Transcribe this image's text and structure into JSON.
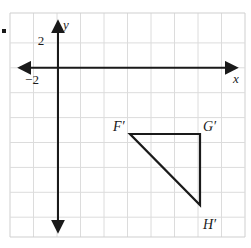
{
  "figure": {
    "background_color": "#ffffff",
    "grid_color": "#d6d6d6",
    "grid_border_color": "#c9c9c9",
    "axis_color": "#1a1a1a",
    "shape_color": "#1a1a1a",
    "label_color": "#1a1a1a"
  },
  "axes": {
    "x_axis_label": "x",
    "y_axis_label": "y",
    "x_tick_label": "−2",
    "y_tick_label": "2",
    "x_tick_value": -2,
    "y_tick_value": 2,
    "origin_px": {
      "x": 58,
      "y": 68
    },
    "cell_px": {
      "w": 23.5,
      "h": 25
    },
    "units_per_cell": 2,
    "x_range": [
      -4,
      16
    ],
    "y_range": [
      -14,
      4
    ],
    "grid_on": true
  },
  "grid": {
    "left_px": 10,
    "top_px": 13,
    "right_px": 245,
    "bottom_px": 237,
    "columns": 10,
    "rows": 9
  },
  "shape": {
    "name": "triangle",
    "vertices": [
      {
        "label": "F′",
        "px": {
          "x": 130,
          "y": 134
        },
        "coord": {
          "x": 6,
          "y": -5
        },
        "label_px": {
          "x": 113,
          "y": 127
        }
      },
      {
        "label": "G′",
        "px": {
          "x": 200,
          "y": 134
        },
        "coord": {
          "x": 12,
          "y": -5
        },
        "label_px": {
          "x": 203,
          "y": 127
        }
      },
      {
        "label": "H′",
        "px": {
          "x": 200,
          "y": 205
        },
        "coord": {
          "x": 12,
          "y": -11
        },
        "label_px": {
          "x": 203,
          "y": 228
        }
      }
    ],
    "stroke_width": 2.2,
    "filled": false
  },
  "marks": {
    "bullet_px": {
      "x": 4,
      "y": 31
    },
    "bullet_size": 4
  }
}
